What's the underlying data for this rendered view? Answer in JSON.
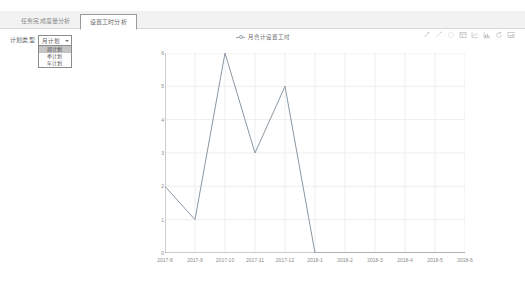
{
  "tabs": [
    {
      "label": "任务完成度量分析",
      "active": false
    },
    {
      "label": "设置工时分析",
      "active": true
    }
  ],
  "filter": {
    "label": "计划类型",
    "selected": "月计划",
    "caret_icon": "chevron-down-icon",
    "options": [
      "周计划",
      "季计划",
      "年计划"
    ],
    "selected_option_index": 0,
    "highlight_color": "#c4c4c4"
  },
  "toolbox": [
    {
      "name": "mark-line-icon",
      "title": "辅助线"
    },
    {
      "name": "mark-point-icon",
      "title": "标注"
    },
    {
      "name": "clear-mark-icon",
      "title": "还原标注"
    },
    {
      "name": "data-view-icon",
      "title": "数据视图"
    },
    {
      "name": "line-chart-icon",
      "title": "折线图切换"
    },
    {
      "name": "bar-chart-icon",
      "title": "柱状图切换"
    },
    {
      "name": "restore-icon",
      "title": "还原"
    },
    {
      "name": "save-image-icon",
      "title": "保存为图片"
    }
  ],
  "chart_data": {
    "type": "line",
    "title": "",
    "legend": [
      "月合计设置工时"
    ],
    "legend_position": "top-center",
    "series": [
      {
        "name": "月合计设置工时",
        "color": "#8a97a3",
        "values": [
          2,
          1,
          6,
          3,
          5,
          0,
          0,
          0,
          0,
          0,
          0
        ]
      }
    ],
    "categories": [
      "2017-8",
      "2017-9",
      "2017-10",
      "2017-11",
      "2017-12",
      "2018-1",
      "2018-2",
      "2018-3",
      "2018-4",
      "2018-5",
      "2018-6"
    ],
    "xlabel": "",
    "ylabel": "",
    "ylim": [
      0,
      6
    ],
    "yticks": [
      0,
      1,
      2,
      3,
      4,
      5,
      6
    ],
    "grid": true
  }
}
